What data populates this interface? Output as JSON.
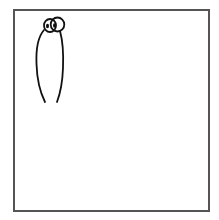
{
  "canvas": {
    "description": "Blank drawing canvas with a simple doodle",
    "border_color": "#555555",
    "background_color": "#ffffff"
  },
  "doodle": {
    "subject": "creature-with-eyes",
    "stroke_color": "#111111",
    "parts": [
      "left-eye",
      "right-eye",
      "left-pupil",
      "right-pupil",
      "body-left-line",
      "body-right-line"
    ]
  }
}
